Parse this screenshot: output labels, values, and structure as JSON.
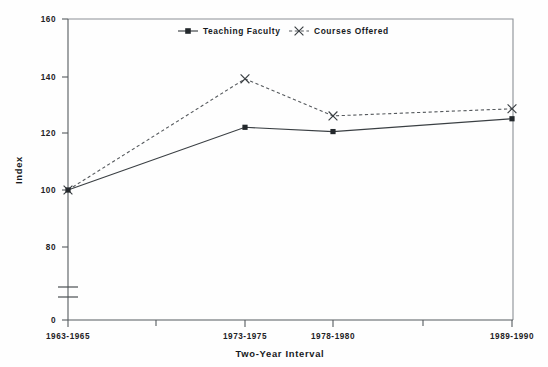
{
  "chart_data": {
    "type": "line",
    "title": "",
    "xlabel": "Two-Year Interval",
    "ylabel": "Index",
    "categories": [
      "1963-1965",
      "1973-1975",
      "1978-1980",
      "1989-1990"
    ],
    "ytick_labels": [
      "0",
      "80",
      "100",
      "120",
      "140",
      "160"
    ],
    "yticks": [
      0,
      80,
      100,
      120,
      140,
      160
    ],
    "ylim": [
      75,
      160
    ],
    "axis_break": true,
    "grid": false,
    "legend_position": "top-center",
    "series": [
      {
        "name": "Teaching Faculty",
        "marker": "square",
        "linestyle": "solid",
        "color": "#333333",
        "values": [
          100,
          122,
          120.5,
          125
        ]
      },
      {
        "name": "Courses Offered",
        "marker": "x",
        "linestyle": "dashed",
        "color": "#444444",
        "values": [
          100,
          139,
          126,
          128.5
        ]
      }
    ]
  },
  "legend": {
    "entries": [
      {
        "label": "Teaching Faculty"
      },
      {
        "label": "Courses Offered"
      }
    ]
  },
  "axes": {
    "y_title": "Index",
    "x_title": "Two-Year Interval"
  }
}
